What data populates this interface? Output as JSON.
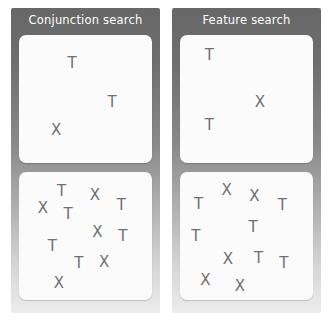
{
  "figure": {
    "background_color": "#ffffff",
    "panel_gradient_top": "#676767",
    "panel_gradient_bottom": "#ececec",
    "stimulus_box_color": "#fbfbfb",
    "glyph_color": "#6f6f6f",
    "title_color": "#ffffff"
  },
  "panels": [
    {
      "id": "conjunction",
      "title": "Conjunction search",
      "displays": [
        {
          "id": "conjunction-small-set",
          "items": [
            {
              "char": "T",
              "x": 40,
              "y": 22
            },
            {
              "char": "T",
              "x": 70,
              "y": 52
            },
            {
              "char": "X",
              "x": 28,
              "y": 74
            }
          ]
        },
        {
          "id": "conjunction-large-set",
          "items": [
            {
              "char": "X",
              "x": 18,
              "y": 28
            },
            {
              "char": "T",
              "x": 32,
              "y": 15
            },
            {
              "char": "T",
              "x": 37,
              "y": 33
            },
            {
              "char": "X",
              "x": 57,
              "y": 18
            },
            {
              "char": "T",
              "x": 77,
              "y": 26
            },
            {
              "char": "X",
              "x": 59,
              "y": 47
            },
            {
              "char": "T",
              "x": 78,
              "y": 50
            },
            {
              "char": "T",
              "x": 25,
              "y": 58
            },
            {
              "char": "T",
              "x": 45,
              "y": 71
            },
            {
              "char": "X",
              "x": 64,
              "y": 70
            },
            {
              "char": "X",
              "x": 30,
              "y": 87
            }
          ]
        }
      ]
    },
    {
      "id": "feature",
      "title": "Feature search",
      "displays": [
        {
          "id": "feature-small-set",
          "items": [
            {
              "char": "T",
              "x": 22,
              "y": 16
            },
            {
              "char": "X",
              "x": 60,
              "y": 52
            },
            {
              "char": "T",
              "x": 22,
              "y": 70
            }
          ]
        },
        {
          "id": "feature-large-set",
          "items": [
            {
              "char": "X",
              "x": 35,
              "y": 14
            },
            {
              "char": "X",
              "x": 56,
              "y": 19
            },
            {
              "char": "T",
              "x": 14,
              "y": 25
            },
            {
              "char": "T",
              "x": 77,
              "y": 26
            },
            {
              "char": "T",
              "x": 55,
              "y": 43
            },
            {
              "char": "T",
              "x": 12,
              "y": 50
            },
            {
              "char": "X",
              "x": 36,
              "y": 68
            },
            {
              "char": "T",
              "x": 59,
              "y": 67
            },
            {
              "char": "T",
              "x": 78,
              "y": 71
            },
            {
              "char": "X",
              "x": 19,
              "y": 84
            },
            {
              "char": "X",
              "x": 45,
              "y": 89
            }
          ]
        }
      ]
    }
  ]
}
